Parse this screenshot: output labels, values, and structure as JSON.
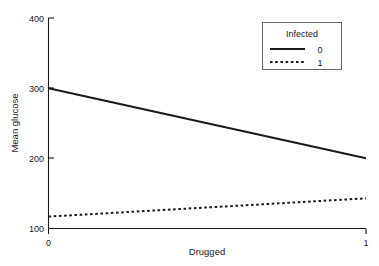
{
  "chart_data": {
    "type": "line",
    "title": "",
    "xlabel": "Drugged",
    "ylabel": "Mean glucose",
    "x": [
      0,
      1
    ],
    "xticks": [
      "0",
      "1"
    ],
    "yticks": [
      "100",
      "200",
      "300",
      "400"
    ],
    "xlim": [
      0,
      1
    ],
    "ylim": [
      100,
      400
    ],
    "grid": false,
    "legend_position": "top-right",
    "legend_title": "Infected",
    "series": [
      {
        "name": "0",
        "style": "solid",
        "color": "#1a1a1a",
        "values": [
          300,
          200
        ]
      },
      {
        "name": "1",
        "style": "dotted",
        "color": "#1a1a1a",
        "values": [
          117,
          143
        ]
      }
    ]
  },
  "axes": {
    "y_tick_400": "400",
    "y_tick_300": "300",
    "y_tick_200": "200",
    "y_tick_100": "100",
    "x_tick_0": "0",
    "x_tick_1": "1",
    "x_title": "Drugged",
    "y_title": "Mean glucose"
  },
  "legend": {
    "title": "Infected",
    "entry_0_label": "0",
    "entry_1_label": "1"
  }
}
